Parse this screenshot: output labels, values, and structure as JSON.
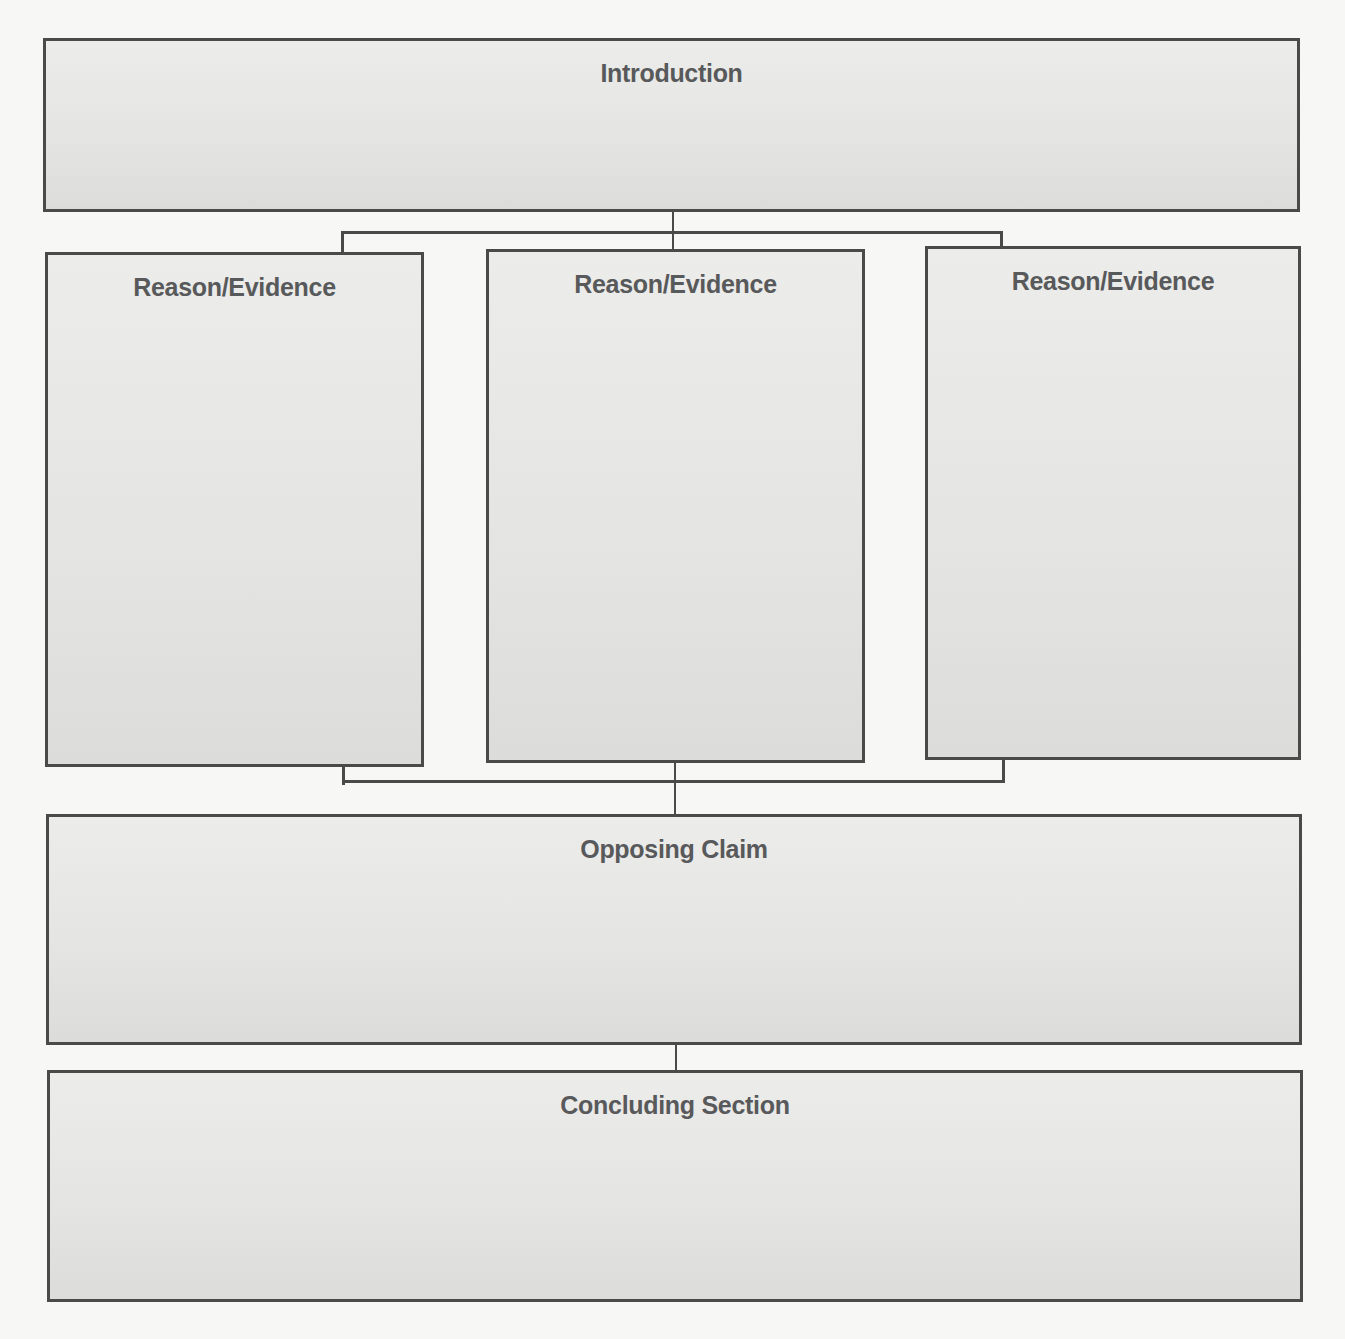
{
  "diagram": {
    "type": "argument-essay-organizer",
    "nodes": {
      "introduction": {
        "label": "Introduction"
      },
      "reasons": [
        {
          "label": "Reason/Evidence"
        },
        {
          "label": "Reason/Evidence"
        },
        {
          "label": "Reason/Evidence"
        }
      ],
      "opposing_claim": {
        "label": "Opposing Claim"
      },
      "concluding_section": {
        "label": "Concluding Section"
      }
    },
    "edges": [
      [
        "introduction",
        "reason_1"
      ],
      [
        "introduction",
        "reason_2"
      ],
      [
        "introduction",
        "reason_3"
      ],
      [
        "reason_1",
        "opposing_claim"
      ],
      [
        "reason_2",
        "opposing_claim"
      ],
      [
        "reason_3",
        "opposing_claim"
      ],
      [
        "opposing_claim",
        "concluding_section"
      ]
    ],
    "colors": {
      "box_fill": "#e6e6e4",
      "box_border": "#4a4a4a",
      "title_text": "#58595b",
      "background": "#f7f7f6"
    }
  }
}
